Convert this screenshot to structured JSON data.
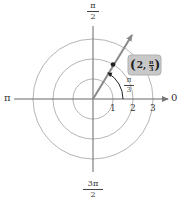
{
  "diagram": {
    "type": "polar-coordinate-plot",
    "colors": {
      "circle": "#b5b5b5",
      "axis": "#666666",
      "ray": "#8a8a8a",
      "point": "#222222",
      "label_box_fill": "#c8c8c8",
      "label_box_stroke": "#b0b0b0"
    },
    "axis_labels": {
      "top": {
        "num": "π",
        "den": "2"
      },
      "bottom": {
        "num": "3π",
        "den": "2"
      },
      "left": "π",
      "right": "0"
    },
    "radial_ticks": [
      "1",
      "2",
      "3"
    ],
    "angle_label": {
      "num": "π",
      "den": "3"
    },
    "point": {
      "r": 2,
      "theta_label": "π/3",
      "label": {
        "open": "(",
        "r": "2,",
        "num": "π",
        "den": "3",
        "close": ")"
      }
    }
  }
}
